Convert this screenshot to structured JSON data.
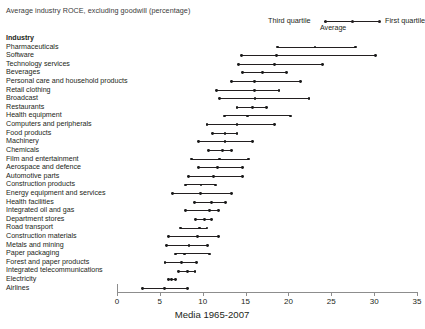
{
  "title": "Average industry ROCE, excluding goodwill (percentage)",
  "legend": {
    "third_quartile": "Third quartile",
    "first_quartile": "First quartile",
    "average": "Average"
  },
  "column_header": "Industry",
  "xlabel": "Media 1965-2007",
  "colors": {
    "ink": "#231f20",
    "axis": "#8d8d8d",
    "marker": "#1a1a1a"
  },
  "chart_data": {
    "type": "range",
    "title": "Average industry ROCE, excluding goodwill (percentage)",
    "xlabel": "Media 1965-2007",
    "ylabel": "Industry",
    "xlim": [
      0,
      35
    ],
    "xticks": [
      0,
      5,
      10,
      15,
      20,
      25,
      30,
      35
    ],
    "grid": false,
    "legend_position": "top-right",
    "series": [
      {
        "name": "Third quartile",
        "role": "low"
      },
      {
        "name": "Average",
        "role": "mid"
      },
      {
        "name": "First quartile",
        "role": "high"
      }
    ],
    "categories": [
      "Pharmaceuticals",
      "Software",
      "Technology services",
      "Beverages",
      "Personal care and household products",
      "Retail clothing",
      "Broadcast",
      "Restaurants",
      "Health equipment",
      "Computers and peripherals",
      "Food products",
      "Machinery",
      "Chemicals",
      "Film and entertainment",
      "Aerospace and defence",
      "Automotive parts",
      "Construction products",
      "Energy equipment and services",
      "Health facilities",
      "Integrated oil and gas",
      "Department stores",
      "Road transport",
      "Construction materials",
      "Metals and mining",
      "Paper packaging",
      "Forest and paper products",
      "Integrated telecommunications",
      "Electricity",
      "Airlines"
    ],
    "rows": [
      {
        "category": "Pharmaceuticals",
        "third_quartile": 18.7,
        "average": 23.1,
        "first_quartile": 27.8
      },
      {
        "category": "Software",
        "third_quartile": 14.5,
        "average": 18.6,
        "first_quartile": 30.2
      },
      {
        "category": "Technology services",
        "third_quartile": 14.2,
        "average": 18.4,
        "first_quartile": 24.0
      },
      {
        "category": "Beverages",
        "third_quartile": 14.6,
        "average": 17.0,
        "first_quartile": 19.8
      },
      {
        "category": "Personal care and household products",
        "third_quartile": 13.4,
        "average": 16.0,
        "first_quartile": 21.4
      },
      {
        "category": "Retail clothing",
        "third_quartile": 11.6,
        "average": 16.0,
        "first_quartile": 18.9
      },
      {
        "category": "Broadcast",
        "third_quartile": 12.0,
        "average": 16.1,
        "first_quartile": 22.4
      },
      {
        "category": "Restaurants",
        "third_quartile": 14.0,
        "average": 15.8,
        "first_quartile": 17.4
      },
      {
        "category": "Health equipment",
        "third_quartile": 12.5,
        "average": 15.2,
        "first_quartile": 20.2
      },
      {
        "category": "Computers and peripherals",
        "third_quartile": 10.5,
        "average": 14.0,
        "first_quartile": 18.4
      },
      {
        "category": "Food products",
        "third_quartile": 11.1,
        "average": 12.6,
        "first_quartile": 14.0
      },
      {
        "category": "Machinery",
        "third_quartile": 9.5,
        "average": 12.6,
        "first_quartile": 15.8
      },
      {
        "category": "Chemicals",
        "third_quartile": 10.7,
        "average": 12.3,
        "first_quartile": 13.4
      },
      {
        "category": "Film and entertainment",
        "third_quartile": 8.7,
        "average": 12.0,
        "first_quartile": 15.3
      },
      {
        "category": "Aerospace and defence",
        "third_quartile": 9.5,
        "average": 11.7,
        "first_quartile": 14.6
      },
      {
        "category": "Automotive parts",
        "third_quartile": 8.3,
        "average": 11.3,
        "first_quartile": 14.6
      },
      {
        "category": "Construction products",
        "third_quartile": 8.0,
        "average": 9.8,
        "first_quartile": 11.5
      },
      {
        "category": "Energy equipment and services",
        "third_quartile": 6.5,
        "average": 9.7,
        "first_quartile": 13.4
      },
      {
        "category": "Health facilities",
        "third_quartile": 9.0,
        "average": 11.0,
        "first_quartile": 12.7
      },
      {
        "category": "Integrated oil and gas",
        "third_quartile": 8.0,
        "average": 10.8,
        "first_quartile": 11.8
      },
      {
        "category": "Department stores",
        "third_quartile": 9.2,
        "average": 10.2,
        "first_quartile": 11.0
      },
      {
        "category": "Road transport",
        "third_quartile": 7.4,
        "average": 9.6,
        "first_quartile": 10.5
      },
      {
        "category": "Construction materials",
        "third_quartile": 6.0,
        "average": 9.4,
        "first_quartile": 11.8
      },
      {
        "category": "Metals and mining",
        "third_quartile": 5.8,
        "average": 8.4,
        "first_quartile": 10.6
      },
      {
        "category": "Paper packaging",
        "third_quartile": 6.8,
        "average": 7.9,
        "first_quartile": 10.8
      },
      {
        "category": "Forest and paper products",
        "third_quartile": 5.6,
        "average": 7.5,
        "first_quartile": 9.3
      },
      {
        "category": "Integrated telecommunications",
        "third_quartile": 7.2,
        "average": 8.2,
        "first_quartile": 9.1
      },
      {
        "category": "Electricity",
        "third_quartile": 6.0,
        "average": 6.4,
        "first_quartile": 6.8
      },
      {
        "category": "Airlines",
        "third_quartile": 3.0,
        "average": 5.5,
        "first_quartile": 8.2
      }
    ]
  }
}
